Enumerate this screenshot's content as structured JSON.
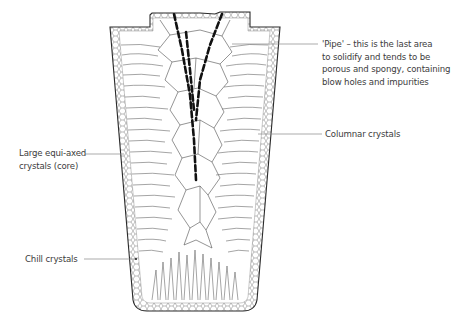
{
  "labels": {
    "pipe": {
      "lines": [
        "'Pipe' – this is the last area",
        "to solidify and tends to be",
        "porous and spongy, containing",
        "blow holes and impurities"
      ]
    },
    "columnar": {
      "text": "Columnar crystals"
    },
    "equiaxed": {
      "lines": [
        "Large equi-axed",
        "crystals (core)"
      ]
    },
    "chill": {
      "text": "Chill crystals"
    }
  },
  "colors": {
    "outline": "#2a2a2a",
    "grain": "#555555",
    "pipe": "#111111",
    "leader": "#888888",
    "text": "#3c3c3c"
  }
}
